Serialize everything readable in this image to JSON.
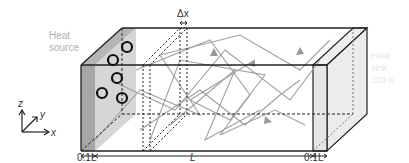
{
  "labels": {
    "heat_source": [
      "Heat",
      "source"
    ],
    "heat_sink": [
      "Heat",
      "sink",
      "300 K"
    ],
    "delta_x": "Δx",
    "dim_left": "0.1L",
    "dim_center": "L",
    "dim_right": "0.1L",
    "axis_x": "x",
    "axis_y": "y",
    "axis_z": "z"
  },
  "colors": {
    "edge": "#222222",
    "source_dark": "#9a9a9a",
    "source_light": "#cfcfcf",
    "sink_fill": "#e4e4e4",
    "path": "#a0a0a0",
    "label_gray": "#b0b0b0",
    "sink_label": "#e6e6e6"
  }
}
